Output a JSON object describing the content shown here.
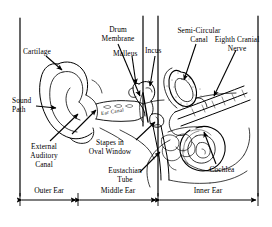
{
  "figure": {
    "background_color": "#ffffff",
    "ink_color": "#000000",
    "width": 272,
    "height": 227
  },
  "labels": {
    "cartilage": "Cartilage",
    "sound_path_line1": "Sound",
    "sound_path_line2": "Path",
    "external_auditory_line1": "External",
    "external_auditory_line2": "Auditory",
    "external_auditory_line3": "Canal",
    "drum_membrane_line1": "Drum",
    "drum_membrane_line2": "Membrane",
    "malleus": "Malleus",
    "incus": "Incus",
    "stapes_line1": "Stapes in",
    "stapes_line2": "Oval Window",
    "eustachian_line1": "Eustachian",
    "eustachian_line2": "Tube",
    "semicircular_line1": "Semi-Circular",
    "semicircular_line2": "Canal",
    "eighth_nerve_line1": "Eighth Cranial",
    "eighth_nerve_line2": "Nerve",
    "cochlea": "Cochlea",
    "ear_canal_inline": "Ear Canal"
  },
  "regions": {
    "outer_ear": "Outer Ear",
    "middle_ear": "Middle Ear",
    "inner_ear": "Inner Ear"
  }
}
